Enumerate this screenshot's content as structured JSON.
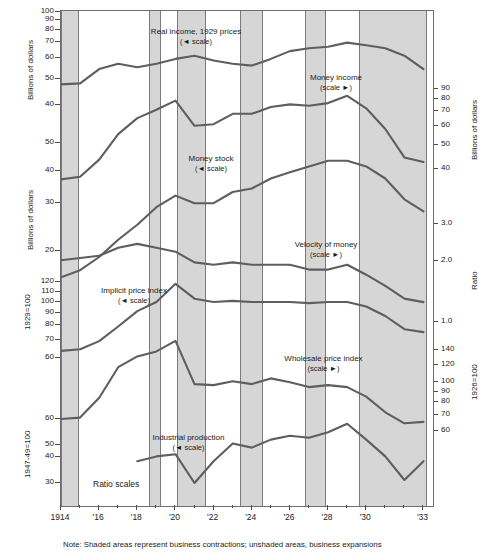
{
  "figure": {
    "note": "Note: Shaded areas represent business contractions; unshaded areas, business expansions",
    "ratio_scales_label": "Ratio scales",
    "scale_left_marker": "(◄ scale)",
    "scale_right_marker": "(scale ►)",
    "line_color": "#5e5e5e",
    "shade_color": "#d6d6d6",
    "frame_color": "#6d6d6d"
  },
  "axes": {
    "left": [
      {
        "title": "Billions of dollars",
        "ticks": [
          "100",
          "90",
          "80",
          "70",
          "60",
          "50",
          "40"
        ]
      },
      {
        "title": "Billions of dollars",
        "ticks": [
          "50",
          "40",
          "30",
          "20"
        ]
      },
      {
        "title": "1929=100",
        "ticks": [
          "120",
          "110",
          "100",
          "90",
          "80",
          "70",
          "60"
        ]
      },
      {
        "title": "1947-49=100",
        "ticks": [
          "60",
          "50",
          "40",
          "30"
        ]
      }
    ],
    "right": [
      {
        "title": "Billions of dollars",
        "ticks": [
          "90",
          "80",
          "70",
          "60",
          "50",
          "40"
        ]
      },
      {
        "title": "Ratio",
        "ticks": [
          "3.0",
          "2.0",
          "1.0"
        ]
      },
      {
        "title": "1926=100",
        "ticks": [
          "140",
          "120",
          "100",
          "90",
          "80",
          "70",
          "60"
        ]
      }
    ],
    "x": {
      "labels": [
        "1914",
        "'16",
        "'18",
        "'20",
        "'22",
        "'24",
        "'26",
        "'28",
        "'30",
        "'33"
      ]
    }
  },
  "series_labels": [
    {
      "name": "real-income",
      "text": "Real income, 1929 prices",
      "scale": "(◄ scale)"
    },
    {
      "name": "money-income",
      "text": "Money income",
      "scale": "(scale ►)"
    },
    {
      "name": "money-stock",
      "text": "Money stock",
      "scale": "(◄ scale)"
    },
    {
      "name": "velocity-of-money",
      "text": "Velocity of money",
      "scale": "(scale ►)"
    },
    {
      "name": "implicit-price-index",
      "text": "Implicit price index",
      "scale": "(◄ scale)"
    },
    {
      "name": "wholesale-price-index",
      "text": "Wholesale price index",
      "scale": "(scale ►)"
    },
    {
      "name": "industrial-production",
      "text": "Industrial production",
      "scale": "(◄ scale)"
    }
  ],
  "chart_data": {
    "type": "line",
    "title": "",
    "xlabel": "",
    "ylabel": "",
    "grid": false,
    "legend": "inline annotations",
    "x_range": [
      1914,
      1933.5
    ],
    "recession_bands": [
      [
        1914.0,
        1914.9
      ],
      [
        1918.6,
        1919.2
      ],
      [
        1920.1,
        1921.55
      ],
      [
        1923.4,
        1924.55
      ],
      [
        1926.8,
        1927.85
      ],
      [
        1929.6,
        1933.15
      ]
    ],
    "series": [
      {
        "name": "Real income, 1929 prices",
        "units": "Billions of dollars",
        "scale_side": "left",
        "axis_ticks": [
          100,
          90,
          80,
          70,
          60,
          50,
          40
        ],
        "x": [
          1914,
          1915,
          1916,
          1917,
          1918,
          1919,
          1920,
          1921,
          1922,
          1923,
          1924,
          1925,
          1926,
          1927,
          1928,
          1929,
          1930,
          1931,
          1932,
          1933
        ],
        "values": [
          49,
          49.5,
          57,
          60,
          58,
          60,
          63,
          65,
          62,
          60,
          59,
          63,
          68,
          70,
          71,
          74,
          72,
          70,
          65,
          57
        ]
      },
      {
        "name": "Money income",
        "units": "Billions of dollars",
        "scale_side": "right",
        "axis_ticks": [
          90,
          80,
          70,
          60,
          50,
          40
        ],
        "x": [
          1914,
          1915,
          1916,
          1917,
          1918,
          1919,
          1920,
          1921,
          1922,
          1923,
          1924,
          1925,
          1926,
          1927,
          1928,
          1929,
          1930,
          1931,
          1932,
          1933
        ],
        "values": [
          36,
          37,
          44,
          57,
          67,
          73,
          80,
          62,
          63,
          70,
          70,
          75,
          77,
          76,
          78,
          84,
          74,
          60,
          45,
          43
        ]
      },
      {
        "name": "Money stock",
        "units": "Billions of dollars",
        "scale_side": "left",
        "axis_ticks": [
          50,
          40,
          30,
          20
        ],
        "x": [
          1914,
          1915,
          1916,
          1917,
          1918,
          1919,
          1920,
          1921,
          1922,
          1923,
          1924,
          1925,
          1926,
          1927,
          1928,
          1929,
          1930,
          1931,
          1932,
          1933
        ],
        "values": [
          16,
          17,
          19,
          22,
          25,
          29,
          32,
          30,
          30,
          33,
          34,
          37,
          39,
          41,
          43,
          43,
          41,
          37,
          31,
          28
        ]
      },
      {
        "name": "Velocity of money",
        "units": "Ratio",
        "scale_side": "right",
        "axis_ticks": [
          3.0,
          2.0,
          1.0
        ],
        "x": [
          1914,
          1915,
          1916,
          1917,
          1918,
          1919,
          1920,
          1921,
          1922,
          1923,
          1924,
          1925,
          1926,
          1927,
          1928,
          1929,
          1930,
          1931,
          1932,
          1933
        ],
        "values": [
          2.0,
          2.05,
          2.1,
          2.3,
          2.4,
          2.3,
          2.2,
          1.95,
          1.9,
          1.95,
          1.9,
          1.9,
          1.9,
          1.8,
          1.8,
          1.9,
          1.7,
          1.5,
          1.3,
          1.25
        ]
      },
      {
        "name": "Implicit price index",
        "units": "1929=100",
        "scale_side": "left",
        "axis_ticks": [
          120,
          110,
          100,
          90,
          80,
          70,
          60
        ],
        "x": [
          1914,
          1915,
          1916,
          1917,
          1918,
          1919,
          1920,
          1921,
          1922,
          1923,
          1924,
          1925,
          1926,
          1927,
          1928,
          1929,
          1930,
          1931,
          1932,
          1933
        ],
        "values": [
          64,
          65,
          70,
          80,
          92,
          100,
          118,
          103,
          100,
          101,
          100,
          100,
          100,
          99,
          100,
          100,
          96,
          88,
          78,
          76
        ]
      },
      {
        "name": "Wholesale price index",
        "units": "1926=100",
        "scale_side": "right",
        "axis_ticks": [
          140,
          120,
          100,
          90,
          80,
          70,
          60
        ],
        "x": [
          1914,
          1915,
          1916,
          1917,
          1918,
          1919,
          1920,
          1921,
          1922,
          1923,
          1924,
          1925,
          1926,
          1927,
          1928,
          1929,
          1930,
          1931,
          1932,
          1933
        ],
        "values": [
          68,
          69,
          85,
          117,
          131,
          138,
          154,
          98,
          97,
          101,
          98,
          104,
          100,
          95,
          97,
          95,
          86,
          73,
          65,
          66
        ]
      },
      {
        "name": "Industrial production",
        "units": "1947-49=100",
        "scale_side": "left",
        "axis_ticks": [
          60,
          50,
          40,
          30
        ],
        "x": [
          1918,
          1919,
          1920,
          1921,
          1922,
          1923,
          1924,
          1925,
          1926,
          1927,
          1928,
          1929,
          1930,
          1931,
          1932,
          1933
        ],
        "values": [
          38,
          40,
          41,
          30,
          38,
          46,
          44,
          48,
          50,
          49,
          52,
          57,
          48,
          40,
          31,
          38
        ]
      }
    ]
  }
}
